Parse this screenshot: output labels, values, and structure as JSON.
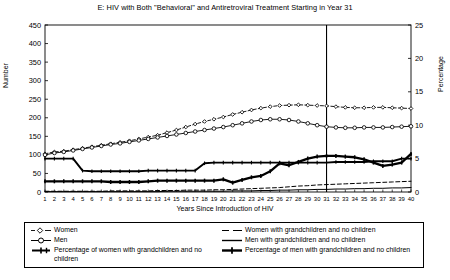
{
  "chart_data": {
    "type": "line",
    "title": "E: HIV with Both \"Behavioral\" and Antiretroviral Treatment Starting in Year 31",
    "xlabel": "Years Since Introduction of HIV",
    "ylabel": "Number",
    "y2label": "Percentage",
    "xlim": [
      1,
      40
    ],
    "ylim": [
      0,
      450
    ],
    "y2lim": [
      0,
      25
    ],
    "yticks": [
      0,
      50,
      100,
      150,
      200,
      250,
      300,
      350,
      400,
      450
    ],
    "y2ticks": [
      0,
      5,
      10,
      15,
      20,
      25
    ],
    "grid": false,
    "legend_position": "below",
    "annotations": [
      {
        "type": "vline",
        "x": 31,
        "label": "Treatment starts in Year 31"
      }
    ],
    "x": [
      1,
      2,
      3,
      4,
      5,
      6,
      7,
      8,
      9,
      10,
      11,
      12,
      13,
      14,
      15,
      16,
      17,
      18,
      19,
      20,
      21,
      22,
      23,
      24,
      25,
      26,
      27,
      28,
      29,
      30,
      31,
      32,
      33,
      34,
      35,
      36,
      37,
      38,
      39,
      40
    ],
    "xticklabels": [
      "1",
      "2",
      "3",
      "4",
      "5",
      "6",
      "7",
      "8",
      "9",
      "10",
      "11",
      "12",
      "13",
      "14",
      "15",
      "16",
      "17",
      "18",
      "19",
      "20",
      "21",
      "22",
      "23",
      "24",
      "25",
      "26",
      "27",
      "28",
      "29",
      "30",
      "31",
      "32",
      "33",
      "34",
      "35",
      "36",
      "37",
      "38",
      "39",
      "40"
    ],
    "series": [
      {
        "name": "Women",
        "axis": "left",
        "style": "dashed",
        "marker": "open-diamond",
        "values": [
          103,
          108,
          110,
          114,
          118,
          122,
          126,
          130,
          134,
          138,
          143,
          148,
          153,
          160,
          167,
          175,
          183,
          190,
          196,
          202,
          209,
          215,
          221,
          226,
          230,
          233,
          234,
          235,
          234,
          233,
          232,
          230,
          228,
          227,
          227,
          228,
          228,
          227,
          226,
          225
        ]
      },
      {
        "name": "Men",
        "axis": "left",
        "style": "solid",
        "marker": "open-circle",
        "values": [
          100,
          105,
          108,
          112,
          116,
          120,
          124,
          128,
          131,
          135,
          139,
          143,
          147,
          151,
          155,
          159,
          163,
          167,
          171,
          175,
          180,
          185,
          190,
          194,
          196,
          196,
          194,
          190,
          185,
          180,
          176,
          174,
          173,
          173,
          174,
          174,
          174,
          175,
          176,
          177
        ]
      },
      {
        "name": "Percentage of women with grandchildren and no children",
        "axis": "right",
        "style": "solid-thick",
        "marker": "plus",
        "values": [
          5.0,
          5.0,
          5.0,
          5.0,
          3.2,
          3.1,
          3.1,
          3.1,
          3.1,
          3.1,
          3.1,
          3.2,
          3.2,
          3.2,
          3.2,
          3.2,
          3.2,
          4.3,
          4.4,
          4.4,
          4.4,
          4.4,
          4.4,
          4.4,
          4.4,
          4.4,
          4.4,
          4.4,
          4.4,
          4.4,
          4.4,
          4.5,
          4.5,
          4.5,
          4.5,
          4.6,
          4.6,
          4.6,
          5.0,
          5.0
        ]
      },
      {
        "name": "Percentage of men with grandchildren and no children",
        "axis": "right",
        "style": "bold",
        "marker": "plus",
        "values": [
          1.6,
          1.6,
          1.6,
          1.6,
          1.6,
          1.6,
          1.6,
          1.5,
          1.5,
          1.5,
          1.5,
          1.6,
          1.7,
          1.7,
          1.7,
          1.7,
          1.7,
          1.7,
          1.7,
          1.9,
          1.4,
          1.8,
          2.2,
          2.4,
          3.1,
          4.3,
          4.0,
          4.5,
          5.0,
          5.3,
          5.4,
          5.4,
          5.3,
          5.2,
          4.9,
          4.4,
          3.9,
          4.1,
          4.4,
          5.7
        ]
      },
      {
        "name": "Women with grandchildren and no children",
        "axis": "left",
        "style": "dashed-thin",
        "marker": "none",
        "values": [
          2,
          2,
          2,
          2,
          2,
          2,
          2,
          3,
          3,
          3,
          3,
          3,
          4,
          4,
          4,
          5,
          5,
          5,
          6,
          6,
          7,
          8,
          9,
          10,
          11,
          12,
          14,
          16,
          17,
          19,
          20,
          21,
          22,
          23,
          24,
          25,
          26,
          27,
          28,
          29
        ]
      },
      {
        "name": "Men with grandchildren and no children",
        "axis": "left",
        "style": "solid-thin",
        "marker": "none",
        "values": [
          1,
          1,
          1,
          1,
          1,
          1,
          1,
          1,
          1,
          1,
          1,
          1,
          1,
          2,
          2,
          2,
          2,
          2,
          2,
          2,
          3,
          3,
          3,
          4,
          4,
          5,
          5,
          6,
          6,
          7,
          7,
          8,
          8,
          9,
          9,
          10,
          10,
          11,
          11,
          12
        ]
      }
    ]
  },
  "legend": {
    "items": [
      {
        "label": "Women",
        "marker": "dashed-open-diamond"
      },
      {
        "label": "Men",
        "marker": "solid-open-circle"
      },
      {
        "label": "Percentage of women with grandchildren and no children",
        "marker": "thick-plus"
      },
      {
        "label": "Women with grandchildren and no children",
        "marker": "dashed-thin"
      },
      {
        "label": "Men with grandchildren and no children",
        "marker": "solid-thin"
      },
      {
        "label": "Percentage of men with grandchildren and no children",
        "marker": "bold-plus"
      }
    ]
  },
  "colors": {
    "line": "#000000",
    "background": "#ffffff",
    "axis": "#000000"
  }
}
